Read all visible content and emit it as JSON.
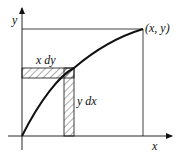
{
  "diagram": {
    "axes": {
      "x_label": "x",
      "y_label": "y"
    },
    "point_label": "(x, y)",
    "strip_labels": {
      "horizontal": "x dy",
      "vertical": "y dx"
    },
    "colors": {
      "stroke": "#111111",
      "hatch": "#333333",
      "background": "#ffffff"
    }
  }
}
